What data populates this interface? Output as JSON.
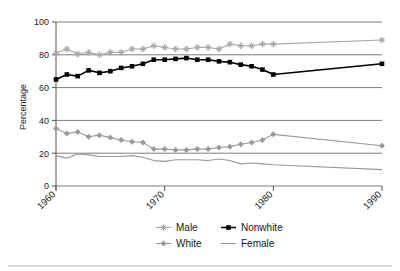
{
  "chart_data": {
    "type": "line",
    "title": "",
    "xlabel": "",
    "ylabel": "Percentage",
    "xlim": [
      1960,
      1990
    ],
    "ylim": [
      0,
      100
    ],
    "grid": true,
    "legend_position": "bottom",
    "xticks": [
      "1960",
      "1970",
      "1980",
      "1990"
    ],
    "xtick_values": [
      1960,
      1970,
      1980,
      1990
    ],
    "yticks": [
      "0",
      "20",
      "40",
      "60",
      "80",
      "100"
    ],
    "ytick_values": [
      0,
      20,
      40,
      60,
      80,
      100
    ],
    "series": [
      {
        "name": "Male",
        "color": "#a8a8a8",
        "marker": "star",
        "x": [
          1960,
          1961,
          1962,
          1963,
          1964,
          1965,
          1966,
          1967,
          1968,
          1969,
          1970,
          1971,
          1972,
          1973,
          1974,
          1975,
          1976,
          1977,
          1978,
          1979,
          1980,
          1990
        ],
        "values": [
          81,
          83.5,
          80.5,
          81.5,
          80,
          81.5,
          81.5,
          83.5,
          83.5,
          85.5,
          84.5,
          83.5,
          83.5,
          84.5,
          84.5,
          83.5,
          86.5,
          85.5,
          85.5,
          86.5,
          86.5,
          89
        ]
      },
      {
        "name": "Nonwhite",
        "color": "#000000",
        "marker": "square",
        "x": [
          1960,
          1961,
          1962,
          1963,
          1964,
          1965,
          1966,
          1967,
          1968,
          1969,
          1970,
          1971,
          1972,
          1973,
          1974,
          1975,
          1976,
          1977,
          1978,
          1979,
          1980,
          1990
        ],
        "values": [
          65,
          68,
          67,
          70.5,
          69,
          70,
          72,
          73,
          74.5,
          77,
          77,
          77.5,
          78,
          77,
          77,
          76,
          75.5,
          74,
          73,
          71,
          68,
          74.5
        ]
      },
      {
        "name": "White",
        "color": "#9a9a9a",
        "marker": "diamond",
        "x": [
          1960,
          1961,
          1962,
          1963,
          1964,
          1965,
          1966,
          1967,
          1968,
          1969,
          1970,
          1971,
          1972,
          1973,
          1974,
          1975,
          1976,
          1977,
          1978,
          1979,
          1980,
          1990
        ],
        "values": [
          35,
          32,
          33,
          30,
          31,
          29.5,
          28,
          27,
          26.5,
          22.5,
          22.5,
          22,
          22,
          22.5,
          22.5,
          23.5,
          24,
          25.5,
          26.5,
          28,
          31.5,
          24.5
        ]
      },
      {
        "name": "Female",
        "color": "#999999",
        "marker": "none",
        "x": [
          1960,
          1961,
          1962,
          1963,
          1964,
          1965,
          1966,
          1967,
          1968,
          1969,
          1970,
          1971,
          1972,
          1973,
          1974,
          1975,
          1976,
          1977,
          1978,
          1979,
          1980,
          1990
        ],
        "values": [
          18.5,
          17,
          19.5,
          19,
          18,
          18,
          18,
          18.5,
          17.5,
          15.5,
          15,
          16,
          16,
          16,
          15.5,
          16.5,
          15.5,
          13.5,
          14,
          13.5,
          13,
          10
        ]
      }
    ]
  },
  "legend": {
    "entries": [
      {
        "label": "Male",
        "marker": "star-marker",
        "color": "#a8a8a8"
      },
      {
        "label": "Nonwhite",
        "marker": "square-marker",
        "color": "#000000"
      },
      {
        "label": "White",
        "marker": "diamond-marker",
        "color": "#9a9a9a"
      },
      {
        "label": "Female",
        "marker": "line-marker",
        "color": "#999999"
      }
    ]
  },
  "axes": {
    "y_title": "Percentage"
  }
}
